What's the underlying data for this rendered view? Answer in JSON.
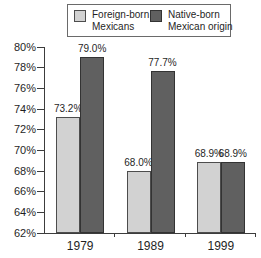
{
  "chart_data": {
    "type": "bar",
    "title": "",
    "xlabel": "",
    "ylabel": "",
    "categories": [
      "1979",
      "1989",
      "1999"
    ],
    "series": [
      {
        "name": "Foreign-born Mexicans",
        "legend_lines": [
          "Foreign-born",
          "Mexicans"
        ],
        "values": [
          73.2,
          68.0,
          68.9
        ],
        "value_labels": [
          "73.2%",
          "68.0%",
          "68.9%"
        ],
        "color": "#d2d2d2",
        "border_color": "#4d4d4d"
      },
      {
        "name": "Native-born Mexican origin",
        "legend_lines": [
          "Native-born",
          "Mexican origin"
        ],
        "values": [
          79.0,
          77.7,
          68.9
        ],
        "value_labels": [
          "79.0%",
          "77.7%",
          "68.9%"
        ],
        "color": "#606060",
        "border_color": "#333333"
      }
    ],
    "ylim": [
      62,
      80
    ],
    "ytick_step": 2,
    "ytick_labels": [
      "62%",
      "64%",
      "66%",
      "68%",
      "70%",
      "72%",
      "74%",
      "76%",
      "78%",
      "80%"
    ],
    "grid": false,
    "legend_position": "top-right",
    "axis_color": "#3c3c3c",
    "text_color": "#1f1f1f"
  }
}
